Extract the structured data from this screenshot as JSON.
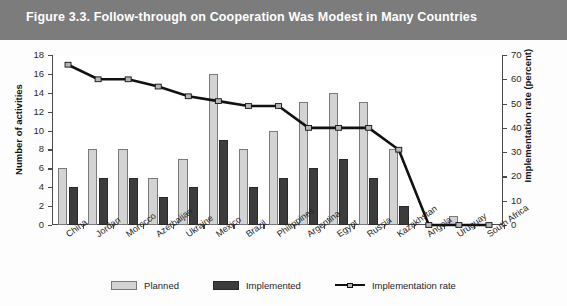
{
  "figure": {
    "title": "Figure 3.3.  Follow-through on Cooperation Was Modest in Many Countries",
    "band_color": "#7c7c7c"
  },
  "legend": {
    "planned_label": "Planned",
    "implemented_label": "Implemented",
    "rate_label": "Implementation rate"
  },
  "colors": {
    "planned": "#d3d3d3",
    "implemented": "#3c3c3c",
    "line": "#111111",
    "marker": "#b5b5b5"
  },
  "chart_data": {
    "type": "bar",
    "title": "Figure 3.3.  Follow-through on Cooperation Was Modest in Many Countries",
    "xlabel": "",
    "ylabel": "Number of activities",
    "y2label": "Implementation rate (percent)",
    "ylim": [
      0,
      18
    ],
    "y2lim": [
      0,
      70
    ],
    "yticks": [
      0,
      2,
      4,
      6,
      8,
      10,
      12,
      14,
      16,
      18
    ],
    "y2ticks": [
      0,
      10,
      20,
      30,
      40,
      50,
      60,
      70
    ],
    "grid": false,
    "legend_position": "bottom",
    "categories": [
      "China",
      "Jordan",
      "Morocco",
      "Azerbaijan",
      "Ukraine",
      "Mexico",
      "Brazil",
      "Philippines",
      "Argentina",
      "Egypt",
      "Russia",
      "Kazakhstan",
      "Angola",
      "Uruguay",
      "South Africa"
    ],
    "series": [
      {
        "name": "Planned",
        "axis": "left",
        "type": "bar",
        "values": [
          6,
          8,
          8,
          5,
          7,
          16,
          8,
          10,
          13,
          14,
          13,
          8,
          0,
          1,
          0
        ]
      },
      {
        "name": "Implemented",
        "axis": "left",
        "type": "bar",
        "values": [
          4,
          5,
          5,
          3,
          4,
          9,
          4,
          5,
          6,
          7,
          5,
          2,
          0,
          0,
          0
        ]
      },
      {
        "name": "Implementation rate",
        "axis": "right",
        "type": "line",
        "values": [
          66,
          60,
          60,
          57,
          53,
          51,
          49,
          49,
          40,
          40,
          40,
          31,
          0,
          0,
          0
        ]
      }
    ]
  }
}
